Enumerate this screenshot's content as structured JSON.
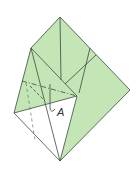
{
  "diagram": {
    "type": "origami-fold-step",
    "colors": {
      "paper_colored": "#c4e6b6",
      "paper_white": "#ffffff",
      "line": "#3a4a3a",
      "background": "#ffffff"
    },
    "labels": {
      "point_a": "A"
    },
    "vertices": {
      "top": [
        60,
        17
      ],
      "right": [
        130,
        90
      ],
      "bottom": [
        60,
        161
      ],
      "left": [
        14,
        113
      ],
      "upper_left": [
        31,
        48
      ],
      "inner": [
        77,
        96
      ]
    },
    "fold_lines": {
      "valley": "dash-dot",
      "mountain": "dashed"
    }
  }
}
